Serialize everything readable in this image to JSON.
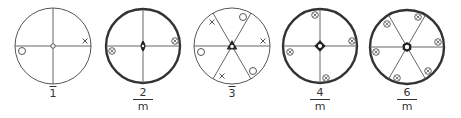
{
  "colors": {
    "line": "#555555",
    "thick": "#333333",
    "symbol": "#555555"
  },
  "diagrams": [
    {
      "id": "1bar",
      "label_type": "bar",
      "label": "1",
      "cx": 53,
      "cy": 46,
      "r": 38,
      "thick": false,
      "mirrors": [
        0,
        90
      ],
      "center": "small-circle",
      "symbols": [
        {
          "type": "cross",
          "x": 85,
          "y": 41
        },
        {
          "type": "circle",
          "x": 22,
          "y": 51
        }
      ]
    },
    {
      "id": "2/m",
      "label_type": "frac",
      "label_num": "2",
      "label_den": "m",
      "cx": 143,
      "cy": 46,
      "r": 37,
      "thick": true,
      "mirrors": [
        0,
        90
      ],
      "center": "lens",
      "symbols": [
        {
          "type": "circled-cross",
          "x": 175,
          "y": 41
        },
        {
          "type": "circled-cross",
          "x": 112,
          "y": 51
        }
      ]
    },
    {
      "id": "3bar",
      "label_type": "bar",
      "label": "3",
      "cx": 232,
      "cy": 46,
      "r": 38,
      "thick": false,
      "mirrors": [
        0,
        60,
        120
      ],
      "center": "triangle",
      "symbols": [
        {
          "type": "cross",
          "x": 212,
          "y": 22
        },
        {
          "type": "circle",
          "x": 243,
          "y": 17
        },
        {
          "type": "cross",
          "x": 263,
          "y": 41
        },
        {
          "type": "circle",
          "x": 201,
          "y": 52
        },
        {
          "type": "cross",
          "x": 222,
          "y": 76
        },
        {
          "type": "circle",
          "x": 253,
          "y": 71
        }
      ]
    },
    {
      "id": "4/m",
      "label_type": "frac",
      "label_num": "4",
      "label_den": "m",
      "cx": 320,
      "cy": 46,
      "r": 37,
      "thick": true,
      "mirrors": [
        0,
        90
      ],
      "center": "square",
      "symbols": [
        {
          "type": "circled-cross",
          "x": 315,
          "y": 15
        },
        {
          "type": "circled-cross",
          "x": 352,
          "y": 41
        },
        {
          "type": "circled-cross",
          "x": 290,
          "y": 52
        },
        {
          "type": "circled-cross",
          "x": 326,
          "y": 78
        }
      ]
    },
    {
      "id": "6/m",
      "label_type": "frac",
      "label_num": "6",
      "label_den": "m",
      "cx": 407,
      "cy": 47,
      "r": 37,
      "thick": true,
      "mirrors": [
        0,
        60,
        120
      ],
      "center": "hexagon",
      "symbols": [
        {
          "type": "circled-cross",
          "x": 387,
          "y": 24
        },
        {
          "type": "circled-cross",
          "x": 418,
          "y": 17
        },
        {
          "type": "circled-cross",
          "x": 438,
          "y": 42
        },
        {
          "type": "circled-cross",
          "x": 376,
          "y": 52
        },
        {
          "type": "circled-cross",
          "x": 397,
          "y": 78
        },
        {
          "type": "circled-cross",
          "x": 428,
          "y": 71
        }
      ]
    }
  ],
  "labels": {
    "d1": "1",
    "d2_num": "2",
    "d2_den": "m",
    "d3": "3",
    "d4_num": "4",
    "d4_den": "m",
    "d6_num": "6",
    "d6_den": "m"
  }
}
